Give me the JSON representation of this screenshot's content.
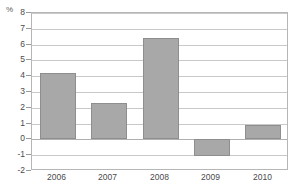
{
  "chart_data": {
    "type": "bar",
    "title": "",
    "subtitle": "",
    "xlabel": "",
    "ylabel": "%",
    "unit_label": "%",
    "categories": [
      "2006",
      "2007",
      "2008",
      "2009",
      "2010"
    ],
    "values": [
      4.2,
      2.3,
      6.4,
      -1.1,
      0.9
    ],
    "series": [
      {
        "name": "",
        "values": [
          4.2,
          2.3,
          6.4,
          -1.1,
          0.9
        ]
      }
    ],
    "ylim": [
      -2,
      8
    ],
    "ytick_step": 1,
    "ytick_labels": [
      "8",
      "7",
      "6",
      "5",
      "4",
      "3",
      "2",
      "1",
      "0",
      "-1",
      "-2"
    ],
    "ytick_values": [
      8,
      7,
      6,
      5,
      4,
      3,
      2,
      1,
      0,
      -1,
      -2
    ],
    "grid": true,
    "grid_axis": "y",
    "legend": false,
    "legend_position": "none",
    "annotations": [],
    "colors": {
      "bar_fill": "#a8a8a8",
      "bar_border": "#8e8e8e",
      "gridline": "#c9c9c9",
      "zero_line": "#b0b0b0",
      "frame": "#b6b6b6",
      "tick_label": "#4a4a4c",
      "unit_label": "#58585a",
      "background": "#ffffff"
    }
  }
}
